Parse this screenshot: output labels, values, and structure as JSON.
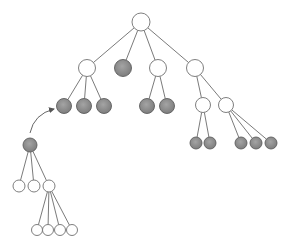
{
  "diagram": {
    "type": "tree",
    "colors": {
      "edge": "#6b6b6b",
      "open_fill": "#ffffff",
      "open_stroke": "#707070",
      "filled_fill": "#8a8a8a",
      "filled_stroke": "#5e5e5e",
      "arrow": "#555555"
    },
    "nodes": [
      {
        "id": "root",
        "x": 141,
        "y": 22,
        "r": 9,
        "filled": false
      },
      {
        "id": "a",
        "x": 87,
        "y": 68,
        "r": 8.5,
        "filled": false
      },
      {
        "id": "b",
        "x": 123,
        "y": 68,
        "r": 8.5,
        "filled": true
      },
      {
        "id": "c",
        "x": 158,
        "y": 68,
        "r": 8.5,
        "filled": false
      },
      {
        "id": "d",
        "x": 195,
        "y": 68,
        "r": 8.5,
        "filled": false
      },
      {
        "id": "a1",
        "x": 64,
        "y": 106,
        "r": 7.5,
        "filled": true
      },
      {
        "id": "a2",
        "x": 84,
        "y": 106,
        "r": 7.5,
        "filled": true
      },
      {
        "id": "a3",
        "x": 104,
        "y": 106,
        "r": 7.5,
        "filled": true
      },
      {
        "id": "c1",
        "x": 147,
        "y": 106,
        "r": 7.5,
        "filled": true
      },
      {
        "id": "c2",
        "x": 167,
        "y": 106,
        "r": 7.5,
        "filled": true
      },
      {
        "id": "d1",
        "x": 203,
        "y": 105,
        "r": 7.5,
        "filled": false
      },
      {
        "id": "d2",
        "x": 226,
        "y": 105,
        "r": 7.5,
        "filled": false
      },
      {
        "id": "d1a",
        "x": 196,
        "y": 143,
        "r": 6,
        "filled": true
      },
      {
        "id": "d1b",
        "x": 210,
        "y": 143,
        "r": 6,
        "filled": true
      },
      {
        "id": "d2a",
        "x": 241,
        "y": 143,
        "r": 6,
        "filled": true
      },
      {
        "id": "d2b",
        "x": 256,
        "y": 143,
        "r": 6,
        "filled": true
      },
      {
        "id": "d2c",
        "x": 271,
        "y": 143,
        "r": 6,
        "filled": true
      },
      {
        "id": "s",
        "x": 30,
        "y": 145,
        "r": 7,
        "filled": true
      },
      {
        "id": "s1",
        "x": 19,
        "y": 186,
        "r": 6,
        "filled": false
      },
      {
        "id": "s2",
        "x": 34,
        "y": 186,
        "r": 6,
        "filled": false
      },
      {
        "id": "s3",
        "x": 49,
        "y": 186,
        "r": 6,
        "filled": false
      },
      {
        "id": "s3a",
        "x": 37,
        "y": 230,
        "r": 5.5,
        "filled": false
      },
      {
        "id": "s3b",
        "x": 48,
        "y": 230,
        "r": 5.5,
        "filled": false
      },
      {
        "id": "s3c",
        "x": 60,
        "y": 230,
        "r": 5.5,
        "filled": false
      },
      {
        "id": "s3d",
        "x": 72,
        "y": 230,
        "r": 5.5,
        "filled": false
      }
    ],
    "edges": [
      [
        "root",
        "a"
      ],
      [
        "root",
        "b"
      ],
      [
        "root",
        "c"
      ],
      [
        "root",
        "d"
      ],
      [
        "a",
        "a1"
      ],
      [
        "a",
        "a2"
      ],
      [
        "a",
        "a3"
      ],
      [
        "c",
        "c1"
      ],
      [
        "c",
        "c2"
      ],
      [
        "d",
        "d1"
      ],
      [
        "d",
        "d2"
      ],
      [
        "d1",
        "d1a"
      ],
      [
        "d1",
        "d1b"
      ],
      [
        "d2",
        "d2a"
      ],
      [
        "d2",
        "d2b"
      ],
      [
        "d2",
        "d2c"
      ],
      [
        "s",
        "s1"
      ],
      [
        "s",
        "s2"
      ],
      [
        "s",
        "s3"
      ],
      [
        "s3",
        "s3a"
      ],
      [
        "s3",
        "s3b"
      ],
      [
        "s3",
        "s3c"
      ],
      [
        "s3",
        "s3d"
      ]
    ],
    "arrow": {
      "from": {
        "x": 30,
        "y": 133
      },
      "control": {
        "x": 34,
        "y": 114
      },
      "to": {
        "x": 54,
        "y": 109
      }
    }
  }
}
